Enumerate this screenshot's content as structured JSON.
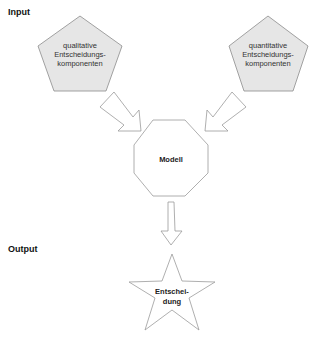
{
  "sections": {
    "input_label": "Input",
    "output_label": "Output"
  },
  "nodes": {
    "qualitative": {
      "shape": "pentagon",
      "lines": [
        "qualitative",
        "Entscheidungs-",
        "komponenten"
      ]
    },
    "quantitative": {
      "shape": "pentagon",
      "lines": [
        "quantitative",
        "Entscheidungs-",
        "komponenten"
      ]
    },
    "model": {
      "shape": "octagon",
      "label": "Modell"
    },
    "decision": {
      "shape": "star",
      "lines": [
        "Entschei-",
        "dung"
      ]
    }
  },
  "edges": [
    {
      "from": "qualitative",
      "to": "model"
    },
    {
      "from": "quantitative",
      "to": "model"
    },
    {
      "from": "model",
      "to": "decision"
    }
  ],
  "colors": {
    "input_fill": "#e6e6e6",
    "outline": "#9a9a9a",
    "text": "#222222"
  }
}
